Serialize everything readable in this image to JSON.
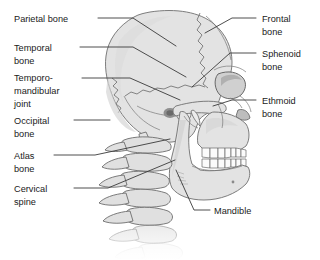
{
  "figure": {
    "background_color": "#ffffff",
    "bone_fill_color": "#e3e3e3",
    "outline_color": "#6f6f6f",
    "leader_line_color": "#3a3a3a",
    "text_color": "#1a1a1a"
  },
  "labels_left": [
    {
      "id": "parietal-bone",
      "lines": [
        "Parietal bone"
      ],
      "text_x": 14,
      "text_y": 22,
      "leader": "M 98 18 L 133 18 L 176 46"
    },
    {
      "id": "temporal-bone",
      "lines": [
        "Temporal",
        "bone"
      ],
      "text_x": 14,
      "text_y": 51,
      "leader": "M 80 47 L 133 47 L 186 77"
    },
    {
      "id": "temporomandibular-joint",
      "lines": [
        "Temporo-",
        "mandibular",
        "joint"
      ],
      "text_x": 14,
      "text_y": 81,
      "leader": "M 82 78 L 130 78 L 180 100"
    },
    {
      "id": "occipital-bone",
      "lines": [
        "Occipital",
        "bone"
      ],
      "text_x": 14,
      "text_y": 124,
      "leader": "M 74 120 L 110 120"
    },
    {
      "id": "atlas-bone",
      "lines": [
        "Atlas",
        "bone"
      ],
      "text_x": 14,
      "text_y": 159,
      "leader": "M 54 155 L 95 155 L 170 139"
    },
    {
      "id": "cervical-spine",
      "lines": [
        "Cervical",
        "spine"
      ],
      "text_x": 14,
      "text_y": 192,
      "leader": "M 74 188 L 108 188 L 175 160"
    }
  ],
  "labels_right": [
    {
      "id": "frontal-bone",
      "lines": [
        "Frontal",
        "bone"
      ],
      "text_x": 262,
      "text_y": 22,
      "leader": "M 256 18 L 232 18 L 205 33"
    },
    {
      "id": "sphenoid-bone",
      "lines": [
        "Sphenoid",
        "bone"
      ],
      "text_x": 262,
      "text_y": 57,
      "leader": "M 256 53 L 230 53 L 192 87"
    },
    {
      "id": "ethmoid-bone",
      "lines": [
        "Ethmoid",
        "bone"
      ],
      "text_x": 262,
      "text_y": 104,
      "leader": "M 256 100 L 232 100 L 213 106"
    }
  ],
  "labels_bottom": [
    {
      "id": "mandible",
      "lines": [
        "Mandible"
      ],
      "text_x": 214,
      "text_y": 214,
      "leader": "M 210 210 L 194 210 L 176 170"
    }
  ]
}
